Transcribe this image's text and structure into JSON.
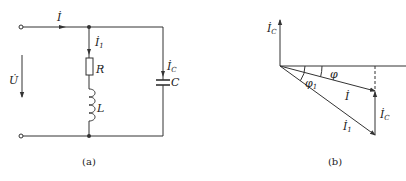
{
  "figure_a": {
    "caption": "(a)",
    "labels": {
      "current_total": "İ",
      "current_branch1": "İ",
      "current_branch1_sub": "1",
      "resistor": "R",
      "inductor": "L",
      "current_cap": "İ",
      "current_cap_sub": "C",
      "capacitor": "C",
      "voltage": "U̇"
    }
  },
  "figure_b": {
    "caption": "(b)",
    "labels": {
      "axis_ic": "İ",
      "axis_ic_sub": "C",
      "phi": "φ",
      "phi1": "φ",
      "phi1_sub": "1",
      "current_total": "İ",
      "current_branch1": "İ",
      "current_branch1_sub": "1",
      "current_cap": "İ",
      "current_cap_sub": "C"
    }
  },
  "colors": {
    "line": "#333333",
    "text": "#222222",
    "background": "#ffffff"
  }
}
